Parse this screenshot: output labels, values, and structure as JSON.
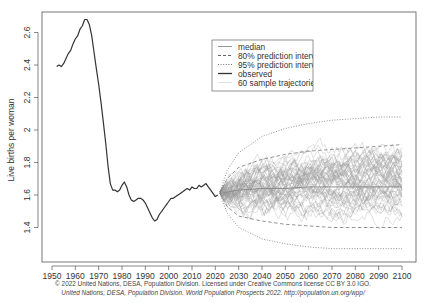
{
  "chart_data": {
    "type": "line",
    "title": "",
    "xlabel": "",
    "ylabel": "Live births per woman",
    "xlim": [
      1946,
      2106
    ],
    "ylim": [
      1.22,
      2.72
    ],
    "x_ticks": [
      1950,
      1960,
      1970,
      1980,
      1990,
      2000,
      2010,
      2020,
      2030,
      2040,
      2050,
      2060,
      2070,
      2080,
      2090,
      2100
    ],
    "y_ticks": [
      1.4,
      1.6,
      1.8,
      2.0,
      2.2,
      2.4,
      2.6
    ],
    "y_tick_labels": [
      "1.4",
      "1.6",
      "1.8",
      "2",
      "2.2",
      "2.4",
      "2.6"
    ],
    "grid": false,
    "legend_position": "top-center",
    "legend": [
      "median",
      "80% prediction interva",
      "95% prediction interva",
      "observed",
      "60 sample trajectories"
    ],
    "series": [
      {
        "name": "observed",
        "style": "solid-dark",
        "x": [
          1952,
          1953,
          1954,
          1955,
          1956,
          1957,
          1958,
          1959,
          1960,
          1961,
          1962,
          1963,
          1964,
          1965,
          1966,
          1967,
          1968,
          1969,
          1970,
          1971,
          1972,
          1973,
          1974,
          1975,
          1976,
          1977,
          1978,
          1979,
          1980,
          1981,
          1982,
          1983,
          1984,
          1985,
          1986,
          1987,
          1988,
          1989,
          1990,
          1991,
          1992,
          1993,
          1994,
          1995,
          1996,
          1997,
          1998,
          1999,
          2000,
          2001,
          2002,
          2003,
          2004,
          2005,
          2006,
          2007,
          2008,
          2009,
          2010,
          2011,
          2012,
          2013,
          2014,
          2015,
          2016,
          2017,
          2018,
          2019,
          2020,
          2021
        ],
        "values": [
          2.39,
          2.4,
          2.39,
          2.41,
          2.44,
          2.47,
          2.49,
          2.53,
          2.56,
          2.58,
          2.62,
          2.64,
          2.68,
          2.68,
          2.65,
          2.58,
          2.48,
          2.38,
          2.28,
          2.17,
          2.05,
          1.92,
          1.78,
          1.67,
          1.63,
          1.63,
          1.62,
          1.63,
          1.66,
          1.68,
          1.65,
          1.6,
          1.57,
          1.56,
          1.57,
          1.58,
          1.58,
          1.57,
          1.55,
          1.52,
          1.49,
          1.46,
          1.44,
          1.45,
          1.48,
          1.5,
          1.52,
          1.54,
          1.56,
          1.58,
          1.58,
          1.59,
          1.6,
          1.61,
          1.62,
          1.63,
          1.64,
          1.63,
          1.65,
          1.64,
          1.64,
          1.66,
          1.65,
          1.66,
          1.67,
          1.65,
          1.63,
          1.61,
          1.59,
          1.6
        ]
      },
      {
        "name": "median",
        "style": "solid-gray",
        "x": [
          2022,
          2030,
          2040,
          2050,
          2060,
          2070,
          2080,
          2090,
          2100
        ],
        "values": [
          1.61,
          1.63,
          1.64,
          1.64,
          1.65,
          1.65,
          1.65,
          1.65,
          1.65
        ]
      },
      {
        "name": "80% prediction interval upper",
        "style": "dashed",
        "x": [
          2022,
          2025,
          2030,
          2040,
          2050,
          2060,
          2070,
          2080,
          2090,
          2100
        ],
        "values": [
          1.61,
          1.7,
          1.77,
          1.82,
          1.85,
          1.87,
          1.88,
          1.89,
          1.9,
          1.91
        ]
      },
      {
        "name": "80% prediction interval lower",
        "style": "dashed",
        "x": [
          2022,
          2025,
          2030,
          2040,
          2050,
          2060,
          2070,
          2080,
          2090,
          2100
        ],
        "values": [
          1.61,
          1.53,
          1.47,
          1.44,
          1.42,
          1.41,
          1.4,
          1.4,
          1.4,
          1.4
        ]
      },
      {
        "name": "95% prediction interval upper",
        "style": "dotted",
        "x": [
          2022,
          2025,
          2030,
          2040,
          2050,
          2060,
          2070,
          2080,
          2090,
          2100
        ],
        "values": [
          1.61,
          1.75,
          1.86,
          1.96,
          2.01,
          2.04,
          2.06,
          2.07,
          2.08,
          2.08
        ]
      },
      {
        "name": "95% prediction interval lower",
        "style": "dotted",
        "x": [
          2022,
          2025,
          2030,
          2040,
          2050,
          2060,
          2070,
          2080,
          2090,
          2100
        ],
        "values": [
          1.61,
          1.49,
          1.4,
          1.33,
          1.3,
          1.28,
          1.27,
          1.27,
          1.27,
          1.27
        ]
      }
    ],
    "sample_trajectories": {
      "count": 60,
      "x_start": 2022,
      "x_end": 2100,
      "start_value": 1.61,
      "color": "#9a9a9a"
    }
  },
  "colors": {
    "observed": "#333333",
    "median": "#8c8c8c",
    "interval": "#777777",
    "trajectories": "#a8a8a8",
    "axis": "#555555"
  },
  "legend": {
    "items": [
      {
        "label": "median"
      },
      {
        "label": "80% prediction interva"
      },
      {
        "label": "95% prediction interva"
      },
      {
        "label": "observed"
      },
      {
        "label": "60 sample trajectories"
      }
    ]
  },
  "credits": {
    "line1": "© 2022 United Nations, DESA, Population Division. Licensed under Creative Commons license CC BY 3.0 IGO.",
    "line2": "United Nations, DESA, Population Division. World Population Prospects 2022. http://population.un.org/wpp/"
  }
}
